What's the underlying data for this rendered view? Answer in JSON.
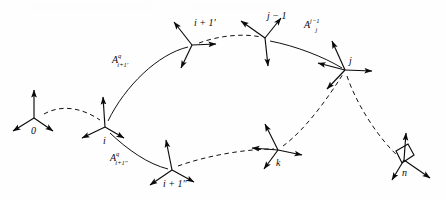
{
  "figure": {
    "type": "kinematic-chain-coordinate-frame-diagram",
    "background_color": "#fefefe",
    "ink_color": "#0a0a0a",
    "width": 446,
    "height": 200
  },
  "nodes": [
    {
      "id": "node-0",
      "label": "0",
      "x": 34,
      "y": 118,
      "label_dx": -3,
      "label_dy": 8,
      "frame_style": "triad-up-left-right"
    },
    {
      "id": "node-i",
      "label": "i",
      "x": 105,
      "y": 127,
      "label_dx": -2,
      "label_dy": 9,
      "frame_style": "triad-up-left-right"
    },
    {
      "id": "node-ip1a",
      "label": "i + 1'",
      "x": 192,
      "y": 45,
      "label_dx": 2,
      "label_dy": -14,
      "frame_style": "triad-upleft-right-down"
    },
    {
      "id": "node-ip1b",
      "label": "i + 1\"",
      "x": 172,
      "y": 170,
      "label_dx": -9,
      "label_dy": 9,
      "frame_style": "triad-up-left-right"
    },
    {
      "id": "node-jm1",
      "label": "j − 1",
      "x": 265,
      "y": 38,
      "label_dx": 2,
      "label_dy": -14,
      "frame_style": "triad-upleft-upright-down"
    },
    {
      "id": "node-j",
      "label": "j",
      "x": 345,
      "y": 70,
      "label_dx": 4,
      "label_dy": -10,
      "frame_style": "triad-up-right-downleft"
    },
    {
      "id": "node-k",
      "label": "k",
      "x": 278,
      "y": 150,
      "label_dx": -2,
      "label_dy": 10,
      "frame_style": "triad-up-left-right"
    },
    {
      "id": "node-n",
      "label": "n",
      "x": 404,
      "y": 160,
      "label_dx": -2,
      "label_dy": 10,
      "frame_style": "triad-up-left-right-box"
    }
  ],
  "matrix_labels": [
    {
      "id": "matrix-a-i-plus-1-prime",
      "base": "A",
      "superscript": "q",
      "subscript": "i+1'",
      "x": 112,
      "y": 54
    },
    {
      "id": "matrix-a-i-plus-1-dprime",
      "base": "A",
      "superscript": "q",
      "subscript": "i+1\"",
      "x": 110,
      "y": 152
    },
    {
      "id": "matrix-a-j",
      "base": "A",
      "superscript": "j−1",
      "subscript": "j",
      "x": 304,
      "y": 19
    }
  ],
  "edges": [
    {
      "id": "edge-0-to-i",
      "style": "dashed",
      "from": "node-0",
      "to": "node-i"
    },
    {
      "id": "edge-i-to-ip1prime",
      "style": "solid",
      "from": "node-i",
      "to": "node-ip1a"
    },
    {
      "id": "edge-i-to-ip1dprime",
      "style": "solid",
      "from": "node-i",
      "to": "node-ip1b"
    },
    {
      "id": "edge-ip1prime-to-jm1",
      "style": "dashed",
      "from": "node-ip1a",
      "to": "node-jm1"
    },
    {
      "id": "edge-jm1-to-j",
      "style": "solid",
      "from": "node-jm1",
      "to": "node-j"
    },
    {
      "id": "edge-ip1dprime-to-k",
      "style": "dashed",
      "from": "node-ip1b",
      "to": "node-k"
    },
    {
      "id": "edge-k-to-j",
      "style": "dashed",
      "from": "node-k",
      "to": "node-j"
    },
    {
      "id": "edge-j-to-n",
      "style": "dashed",
      "from": "node-j",
      "to": "node-n"
    }
  ]
}
